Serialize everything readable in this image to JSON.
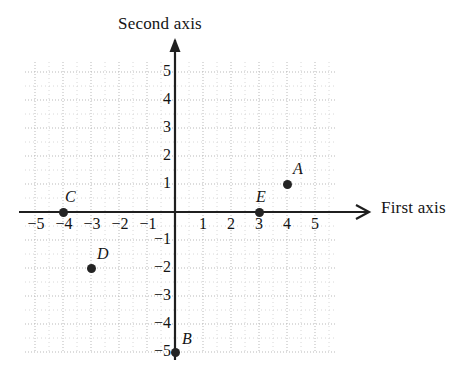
{
  "chart_data": {
    "type": "scatter",
    "title": "",
    "xlabel": "First axis",
    "ylabel": "Second axis",
    "xlim": [
      -5.7,
      5.7
    ],
    "ylim": [
      -5.7,
      5.7
    ],
    "xticks": [
      -5,
      -4,
      -3,
      -2,
      -1,
      1,
      2,
      3,
      4,
      5
    ],
    "yticks": [
      -5,
      -4,
      -3,
      -2,
      -1,
      1,
      2,
      3,
      4,
      5
    ],
    "xtick_labels": [
      "−5",
      "−4",
      "−3",
      "−2",
      "−1",
      "1",
      "2",
      "3",
      "4",
      "5"
    ],
    "ytick_labels": [
      "−5",
      "−4",
      "−3",
      "−2",
      "−1",
      "1",
      "2",
      "3",
      "4",
      "5"
    ],
    "grid": true,
    "grid_style": "dotted",
    "legend": "none",
    "axis_arrows": [
      "x-positive",
      "y-positive"
    ],
    "points": [
      {
        "label": "A",
        "x": 4,
        "y": 1
      },
      {
        "label": "B",
        "x": 0,
        "y": -5
      },
      {
        "label": "C",
        "x": -4,
        "y": 0
      },
      {
        "label": "D",
        "x": -3,
        "y": -2
      },
      {
        "label": "E",
        "x": 3,
        "y": 0
      }
    ]
  },
  "colors": {
    "point": "#242424",
    "axis": "#1f1f1f",
    "grid": "#b9b9b9",
    "grid_minor": "#d8d8d8",
    "text": "#141414",
    "background": "#ffffff"
  },
  "geometry": {
    "origin_x": 175,
    "origin_y": 212,
    "unit": 28,
    "grid_left": 25,
    "grid_right": 337,
    "grid_top": 62,
    "grid_bottom": 352
  }
}
